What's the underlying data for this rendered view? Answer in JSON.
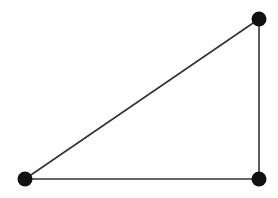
{
  "diagram": {
    "type": "graph",
    "background": "#ffffff",
    "node_color": "#111111",
    "edge_color": "#333333",
    "node_radius": 7.5,
    "edge_width": 1.6,
    "nodes": [
      {
        "id": "A",
        "x": 259,
        "y": 19
      },
      {
        "id": "B",
        "x": 25,
        "y": 179
      },
      {
        "id": "C",
        "x": 259,
        "y": 179
      }
    ],
    "edges": [
      {
        "from": "A",
        "to": "B"
      },
      {
        "from": "A",
        "to": "C"
      },
      {
        "from": "B",
        "to": "C"
      }
    ]
  }
}
